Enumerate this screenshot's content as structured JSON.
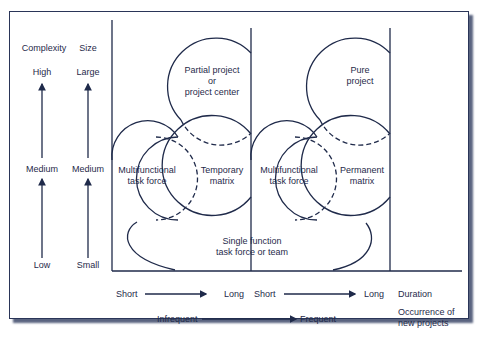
{
  "diagram": {
    "axis_headers": {
      "complexity": "Complexity",
      "size": "Size"
    },
    "complexity_levels": {
      "high": "High",
      "medium": "Medium",
      "low": "Low"
    },
    "size_levels": {
      "large": "Large",
      "medium": "Medium",
      "small": "Small"
    },
    "shapes": {
      "left_partial_project": [
        "Partial project",
        "or",
        "project center"
      ],
      "left_multifunctional": [
        "Multifunctional",
        "task force"
      ],
      "left_temporary_matrix": [
        "Temporary",
        "matrix"
      ],
      "right_multifunctional": [
        "Multifunctional",
        "task force"
      ],
      "right_permanent_matrix": [
        "Permanent",
        "matrix"
      ],
      "right_pure_project": [
        "Pure",
        "project"
      ],
      "single_function": [
        "Single function",
        "task force or team"
      ]
    },
    "duration_axis": {
      "left_start": "Short",
      "left_end": "Long",
      "right_start": "Short",
      "right_end": "Long",
      "label": "Duration"
    },
    "occurrence_axis": {
      "start": "Infrequent",
      "end": "Frequent",
      "label_line1": "Occurrence of",
      "label_line2": "new projects"
    },
    "colors": {
      "ink": "#1f2a4a",
      "shadow": "#5a6480",
      "background": "#ffffff"
    }
  }
}
